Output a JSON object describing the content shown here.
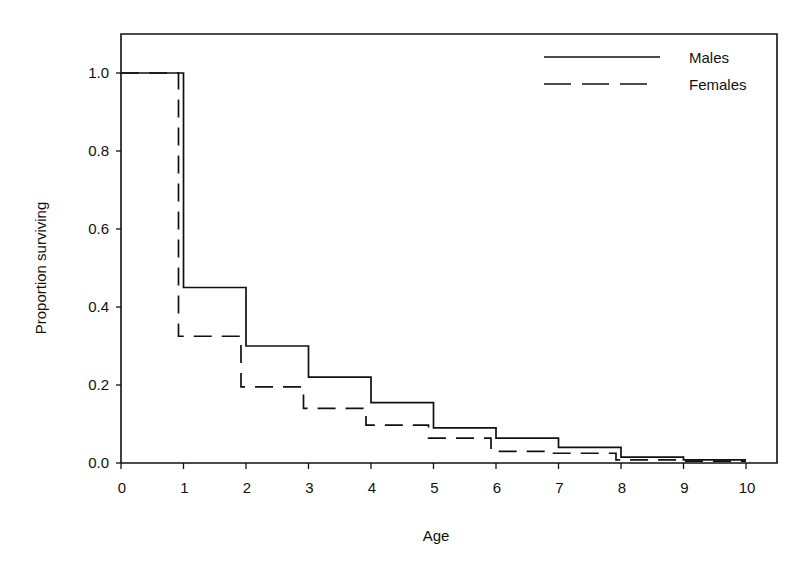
{
  "chart_data": {
    "type": "line",
    "subtype": "step",
    "title": "",
    "xlabel": "Age",
    "ylabel": "Proportion surviving",
    "xlim": [
      0,
      10.5
    ],
    "ylim": [
      0,
      1.1
    ],
    "grid": false,
    "legend_position": "upper right (inside)",
    "x_ticks": [
      0,
      1,
      2,
      3,
      4,
      5,
      6,
      7,
      8,
      9,
      10
    ],
    "x_tick_labels": [
      "0",
      "1",
      "2",
      "3",
      "4",
      "5",
      "6",
      "7",
      "8",
      "9",
      "10"
    ],
    "y_ticks": [
      0.0,
      0.2,
      0.4,
      0.6,
      0.8,
      1.0
    ],
    "y_tick_labels": [
      "0.0",
      "0.2",
      "0.4",
      "0.6",
      "0.8",
      "1.0"
    ],
    "x": [
      0,
      1,
      2,
      3,
      4,
      5,
      6,
      7,
      8,
      9,
      10
    ],
    "series": [
      {
        "name": "Males",
        "style": "solid",
        "color": "#111111",
        "step_x": [
          0,
          1,
          2,
          3,
          4,
          5,
          6,
          7,
          8,
          9,
          10
        ],
        "values": [
          1.0,
          0.45,
          0.3,
          0.22,
          0.155,
          0.09,
          0.064,
          0.04,
          0.015,
          0.008,
          0.008
        ]
      },
      {
        "name": "Females",
        "style": "dashed",
        "color": "#111111",
        "step_x": [
          0,
          0.92,
          1.92,
          2.92,
          3.92,
          4.92,
          5.92,
          6.92,
          7.92,
          8.92,
          10
        ],
        "values": [
          1.0,
          0.325,
          0.195,
          0.14,
          0.097,
          0.064,
          0.03,
          0.025,
          0.008,
          0.005,
          0.005
        ]
      }
    ]
  },
  "legend": {
    "items": [
      {
        "label": "Males",
        "style": "solid"
      },
      {
        "label": "Females",
        "style": "dashed"
      }
    ]
  },
  "axes": {
    "x_title": "Age",
    "y_title": "Proportion surviving"
  }
}
